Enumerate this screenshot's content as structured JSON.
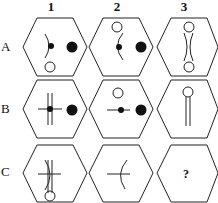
{
  "columns": [
    {
      "label": "1",
      "x": 51
    },
    {
      "label": "2",
      "x": 117
    },
    {
      "label": "3",
      "x": 184
    }
  ],
  "rows": [
    {
      "label": "A",
      "y": 40
    },
    {
      "label": "B",
      "y": 102
    },
    {
      "label": "C",
      "y": 165
    }
  ],
  "missing_cell": {
    "row": "C",
    "col": "3",
    "symbol": "?"
  },
  "colors": {
    "stroke": "#222222",
    "fill": "#111111",
    "background": "#ffffff"
  }
}
